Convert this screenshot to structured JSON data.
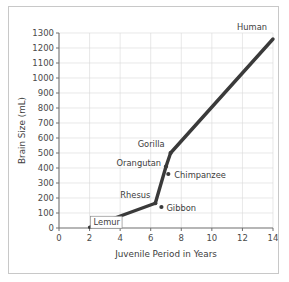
{
  "chart_data": {
    "type": "line",
    "title": "",
    "xlabel": "Juvenile Period in Years",
    "ylabel": "Brain Size (mL)",
    "xlim": [
      0,
      14
    ],
    "ylim": [
      0,
      1300
    ],
    "grid": true,
    "legend": "none",
    "xticks": [
      0,
      2,
      4,
      6,
      8,
      10,
      12,
      14
    ],
    "yticks": [
      0,
      100,
      200,
      300,
      400,
      500,
      600,
      700,
      800,
      900,
      1000,
      1100,
      1200,
      1300
    ],
    "xtick_labels": [
      "0",
      "2",
      "4",
      "6",
      "8",
      "10",
      "12",
      "14"
    ],
    "ytick_labels": [
      "0",
      "100",
      "200",
      "300",
      "400",
      "500",
      "600",
      "700",
      "800",
      "900",
      "1000",
      "1100",
      "1200",
      "1300"
    ],
    "series": [
      {
        "name": "Primate brain size vs juvenile period",
        "x": [
          2.0,
          6.3,
          7.0,
          7.15,
          7.3,
          14.0
        ],
        "y": [
          5,
          165,
          410,
          360,
          500,
          1260
        ]
      }
    ],
    "points": [
      {
        "label": "Lemur",
        "x": 2.0,
        "y": 5,
        "label_dx": 4,
        "label_dy": -2,
        "anchor": "start",
        "marker": false,
        "boxed": true
      },
      {
        "label": "Rhesus",
        "x": 6.3,
        "y": 165,
        "label_dx": -5,
        "label_dy": -5,
        "anchor": "end",
        "marker": true,
        "boxed": false
      },
      {
        "label": "Gibbon",
        "x": 6.7,
        "y": 140,
        "label_dx": 5,
        "label_dy": 4,
        "anchor": "start",
        "marker": true,
        "boxed": false
      },
      {
        "label": "Orangutan",
        "x": 7.0,
        "y": 410,
        "label_dx": -5,
        "label_dy": -1,
        "anchor": "end",
        "marker": true,
        "boxed": false
      },
      {
        "label": "Chimpanzee",
        "x": 7.15,
        "y": 360,
        "label_dx": 6,
        "label_dy": 4,
        "anchor": "start",
        "marker": true,
        "boxed": false
      },
      {
        "label": "Gorilla",
        "x": 7.3,
        "y": 500,
        "label_dx": -6,
        "label_dy": -6,
        "anchor": "end",
        "marker": true,
        "boxed": false
      },
      {
        "label": "Human",
        "x": 14.0,
        "y": 1260,
        "label_dx": -6,
        "label_dy": -9,
        "anchor": "end",
        "marker": false,
        "boxed": false
      }
    ]
  },
  "style": {
    "line_color": "#3a3a3a",
    "grid_color": "#d9d9d9",
    "axis_color": "#6e6e6e",
    "text_color": "#4a4a4a",
    "frame_color": "#c8c8c8",
    "background": "#ffffff"
  }
}
